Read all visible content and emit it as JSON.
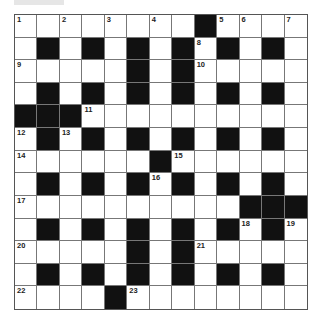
{
  "puzzle": {
    "type": "crossword",
    "rows": 13,
    "cols": 13,
    "grid": [
      "WWWWWWWWBWWWW",
      "WBWBWBWBWBWBW",
      "WWWWWBWBWWWWW",
      "WBWBWBWBWBWBW",
      "BBBWWWWWWWWWW",
      "WBWBWBWBWBWBW",
      "WWWWWWBWWWWWW",
      "WBWBWBWBWBWBW",
      "WWWWWWWWWWBBB",
      "WBWBWBWBWBWBW",
      "WWWWWBWBWWWWW",
      "WBWBWBWBWBWBW",
      "WWWWBWWWWWWWW"
    ],
    "numbers": [
      {
        "r": 0,
        "c": 0,
        "n": "1"
      },
      {
        "r": 0,
        "c": 2,
        "n": "2"
      },
      {
        "r": 0,
        "c": 4,
        "n": "3"
      },
      {
        "r": 0,
        "c": 6,
        "n": "4"
      },
      {
        "r": 0,
        "c": 9,
        "n": "5"
      },
      {
        "r": 0,
        "c": 10,
        "n": "6"
      },
      {
        "r": 0,
        "c": 12,
        "n": "7"
      },
      {
        "r": 1,
        "c": 8,
        "n": "8"
      },
      {
        "r": 2,
        "c": 0,
        "n": "9"
      },
      {
        "r": 2,
        "c": 8,
        "n": "10"
      },
      {
        "r": 4,
        "c": 3,
        "n": "11"
      },
      {
        "r": 5,
        "c": 0,
        "n": "12"
      },
      {
        "r": 5,
        "c": 2,
        "n": "13"
      },
      {
        "r": 6,
        "c": 0,
        "n": "14"
      },
      {
        "r": 6,
        "c": 7,
        "n": "15"
      },
      {
        "r": 7,
        "c": 6,
        "n": "16"
      },
      {
        "r": 8,
        "c": 0,
        "n": "17"
      },
      {
        "r": 9,
        "c": 10,
        "n": "18"
      },
      {
        "r": 9,
        "c": 12,
        "n": "19"
      },
      {
        "r": 10,
        "c": 0,
        "n": "20"
      },
      {
        "r": 10,
        "c": 8,
        "n": "21"
      },
      {
        "r": 12,
        "c": 0,
        "n": "22"
      },
      {
        "r": 12,
        "c": 5,
        "n": "23"
      }
    ],
    "colors": {
      "black_cell": "#111111",
      "white_cell": "#ffffff",
      "grid_line": "#777777"
    }
  }
}
